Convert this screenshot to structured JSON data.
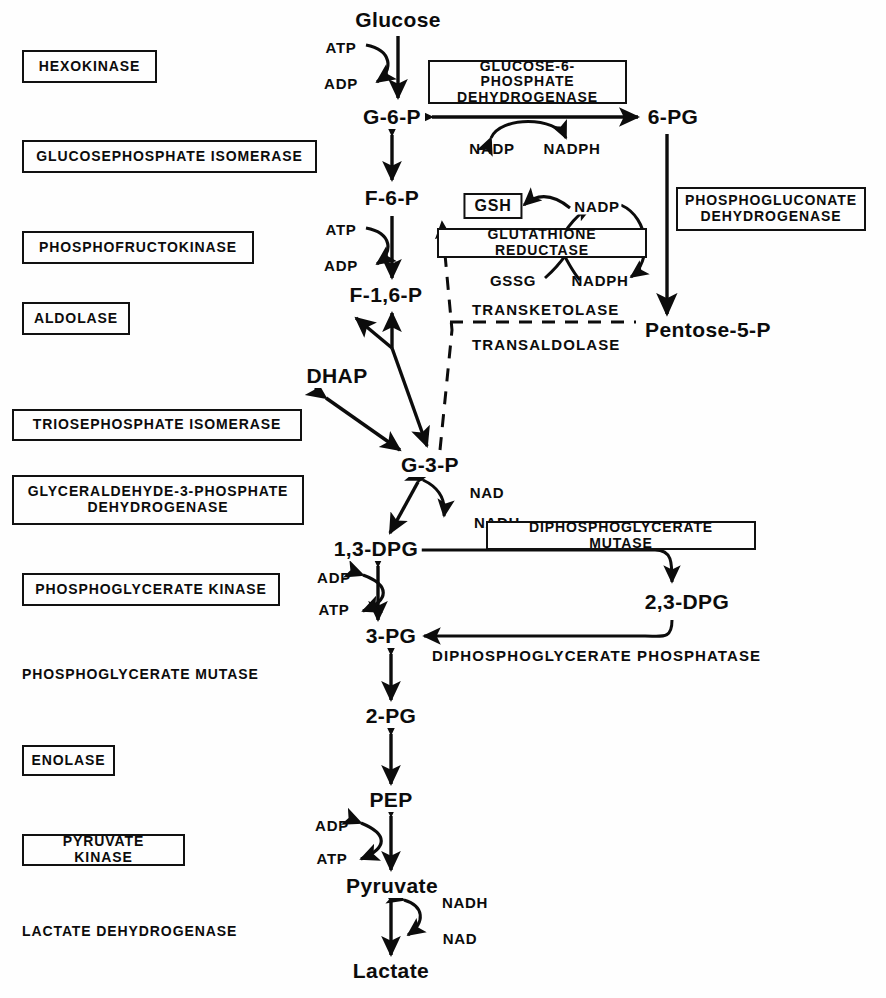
{
  "diagram": {
    "background_color": "#fefefe",
    "ink_color": "#0c0c0c"
  },
  "enzymes": [
    {
      "id": "hexokinase",
      "label": "HEXOKINASE",
      "boxed": true,
      "x": 22,
      "y": 50,
      "w": 135,
      "h": 33,
      "font": 14
    },
    {
      "id": "glucosephosphate-isomerase",
      "label": "GLUCOSEPHOSPHATE  ISOMERASE",
      "boxed": true,
      "x": 22,
      "y": 140,
      "w": 295,
      "h": 33,
      "font": 14
    },
    {
      "id": "phosphofructokinase",
      "label": "PHOSPHOFRUCTOKINASE",
      "boxed": true,
      "x": 22,
      "y": 231,
      "w": 232,
      "h": 33,
      "font": 14
    },
    {
      "id": "aldolase",
      "label": "ALDOLASE",
      "boxed": true,
      "x": 22,
      "y": 302,
      "w": 108,
      "h": 33,
      "font": 14
    },
    {
      "id": "triosephosphate-isomerase",
      "label": "TRIOSEPHOSPHATE  ISOMERASE",
      "boxed": true,
      "x": 12,
      "y": 409,
      "w": 290,
      "h": 32,
      "font": 14
    },
    {
      "id": "glyceraldehyde-3-phosphate-dehydrogenase",
      "label": "GLYCERALDEHYDE-3-PHOSPHATE\nDEHYDROGENASE",
      "boxed": true,
      "x": 12,
      "y": 475,
      "w": 292,
      "h": 50,
      "font": 14
    },
    {
      "id": "phosphoglycerate-kinase",
      "label": "PHOSPHOGLYCERATE  KINASE",
      "boxed": true,
      "x": 22,
      "y": 573,
      "w": 258,
      "h": 33,
      "font": 14
    },
    {
      "id": "phosphoglycerate-mutase",
      "label": "PHOSPHOGLYCERATE  MUTASE",
      "boxed": false,
      "x": 22,
      "y": 667,
      "w": 250,
      "h": 22,
      "font": 14
    },
    {
      "id": "enolase",
      "label": "ENOLASE",
      "boxed": true,
      "x": 22,
      "y": 745,
      "w": 93,
      "h": 31,
      "font": 14
    },
    {
      "id": "pyruvate-kinase",
      "label": "PYRUVATE  KINASE",
      "boxed": true,
      "x": 22,
      "y": 834,
      "w": 163,
      "h": 32,
      "font": 14
    },
    {
      "id": "lactate-dehydrogenase",
      "label": "LACTATE  DEHYDROGENASE",
      "boxed": false,
      "x": 22,
      "y": 924,
      "w": 228,
      "h": 22,
      "font": 14
    },
    {
      "id": "glucose-6-phosphate-dehydrogenase",
      "label": "GLUCOSE-6-PHOSPHATE\nDEHYDROGENASE",
      "boxed": true,
      "x": 428,
      "y": 60,
      "w": 199,
      "h": 44,
      "font": 14
    },
    {
      "id": "phosphogluconate-dehydrogenase",
      "label": "PHOSPHOGLUCONATE\nDEHYDROGENASE",
      "boxed": true,
      "x": 676,
      "y": 187,
      "w": 190,
      "h": 44,
      "font": 14
    },
    {
      "id": "glutathione-reductase",
      "label": "GLUTATHIONE REDUCTASE",
      "boxed": true,
      "x": 437,
      "y": 228,
      "w": 210,
      "h": 30,
      "font": 14
    },
    {
      "id": "diphosphoglycerate-mutase",
      "label": "DIPHOSPHOGLYCERATE  MUTASE",
      "boxed": true,
      "x": 486,
      "y": 521,
      "w": 270,
      "h": 29,
      "font": 14
    }
  ],
  "metabolites": [
    {
      "id": "glucose",
      "label": "Glucose",
      "x": 398,
      "y": 20,
      "size": "big"
    },
    {
      "id": "g-6-p",
      "label": "G-6-P",
      "x": 392,
      "y": 117,
      "size": "big"
    },
    {
      "id": "f-6-p",
      "label": "F-6-P",
      "x": 392,
      "y": 198,
      "size": "big"
    },
    {
      "id": "f-1-6-p",
      "label": "F-1,6-P",
      "x": 386,
      "y": 295,
      "size": "big"
    },
    {
      "id": "dhap",
      "label": "DHAP",
      "x": 337,
      "y": 376,
      "size": "big"
    },
    {
      "id": "g-3-p",
      "label": "G-3-P",
      "x": 430,
      "y": 465,
      "size": "big"
    },
    {
      "id": "1-3-dpg",
      "label": "1,3-DPG",
      "x": 376,
      "y": 549,
      "size": "big"
    },
    {
      "id": "2-3-dpg",
      "label": "2,3-DPG",
      "x": 687,
      "y": 602,
      "size": "big"
    },
    {
      "id": "3-pg",
      "label": "3-PG",
      "x": 391,
      "y": 636,
      "size": "big"
    },
    {
      "id": "2-pg",
      "label": "2-PG",
      "x": 391,
      "y": 716,
      "size": "big"
    },
    {
      "id": "pep",
      "label": "PEP",
      "x": 391,
      "y": 800,
      "size": "big"
    },
    {
      "id": "pyruvate",
      "label": "Pyruvate",
      "x": 392,
      "y": 886,
      "size": "big"
    },
    {
      "id": "lactate",
      "label": "Lactate",
      "x": 391,
      "y": 971,
      "size": "big"
    },
    {
      "id": "6-pg",
      "label": "6-PG",
      "x": 673,
      "y": 117,
      "size": "big"
    },
    {
      "id": "pentose-5-p",
      "label": "Pentose-5-P",
      "x": 708,
      "y": 330,
      "size": "big"
    }
  ],
  "node_boxes": [
    {
      "id": "gsh",
      "label": "GSH",
      "x": 493,
      "y": 206
    }
  ],
  "cofactors": [
    {
      "id": "atp-hexokinase",
      "label": "ATP",
      "x": 341,
      "y": 47
    },
    {
      "id": "adp-hexokinase",
      "label": "ADP",
      "x": 341,
      "y": 83
    },
    {
      "id": "nadp-g6pd",
      "label": "NADP",
      "x": 492,
      "y": 148
    },
    {
      "id": "nadph-g6pd",
      "label": "NADPH",
      "x": 570,
      "y": 148
    },
    {
      "id": "atp-pfk",
      "label": "ATP",
      "x": 341,
      "y": 229
    },
    {
      "id": "adp-pfk",
      "label": "ADP",
      "x": 341,
      "y": 265
    },
    {
      "id": "nadp-gr",
      "label": "NADP",
      "x": 597,
      "y": 206
    },
    {
      "id": "gssg-gr",
      "label": "GSSG",
      "x": 513,
      "y": 280
    },
    {
      "id": "nadph-gr",
      "label": "NADPH",
      "x": 600,
      "y": 280
    },
    {
      "id": "nad-gapdh",
      "label": "NAD",
      "x": 487,
      "y": 492
    },
    {
      "id": "nadh-gapdh",
      "label": "NADH",
      "x": 495,
      "y": 522
    },
    {
      "id": "adp-pgk",
      "label": "ADP",
      "x": 334,
      "y": 577
    },
    {
      "id": "atp-pgk",
      "label": "ATP",
      "x": 334,
      "y": 609
    },
    {
      "id": "adp-pk",
      "label": "ADP",
      "x": 332,
      "y": 825
    },
    {
      "id": "atp-pk",
      "label": "ATP",
      "x": 332,
      "y": 858
    },
    {
      "id": "nadh-ldh",
      "label": "NADH",
      "x": 463,
      "y": 902
    },
    {
      "id": "nad-ldh",
      "label": "NAD",
      "x": 458,
      "y": 938
    }
  ],
  "path_labels": [
    {
      "id": "transketolase",
      "label": "TRANSKETOLASE",
      "x": 470,
      "y": 301
    },
    {
      "id": "transaldolase",
      "label": "TRANSALDOLASE",
      "x": 470,
      "y": 336
    },
    {
      "id": "diphosphoglycerate-phosphatase",
      "label": "DIPHOSPHOGLYCERATE  PHOSPHATASE",
      "x": 432,
      "y": 647
    }
  ]
}
